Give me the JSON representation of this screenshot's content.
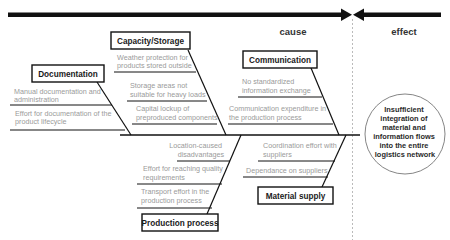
{
  "header": {
    "cause_label": "cause",
    "effect_label": "effect"
  },
  "effect": {
    "lines": [
      "Insufficient",
      "integration of",
      "material and",
      "information flows",
      "into the entire",
      "logistics network"
    ]
  },
  "categories": {
    "documentation": {
      "label": "Documentation",
      "causes": [
        [
          "Manual documentation and",
          "administration"
        ],
        [
          "Effort for documentation of the",
          "product lifecycle"
        ]
      ]
    },
    "capacity_storage": {
      "label": "Capacity/Storage",
      "causes": [
        [
          "Weather protection for",
          "products stored outside"
        ],
        [
          "Storage areas not",
          "suitable for heavy loads"
        ],
        [
          "Capital lockup of",
          "preproduced components"
        ]
      ]
    },
    "communication": {
      "label": "Communication",
      "causes": [
        [
          "No standardized",
          "information exchange"
        ],
        [
          "Communication expenditure in",
          "the production process"
        ]
      ]
    },
    "production_process": {
      "label": "Production process",
      "causes": [
        [
          "Location-caused",
          "disadvantages"
        ],
        [
          "Effort for reaching quality",
          "requirements"
        ],
        [
          "Transport effort in the",
          "production process"
        ]
      ]
    },
    "material_supply": {
      "label": "Material supply",
      "causes": [
        [
          "Coordination effort with",
          "suppliers"
        ],
        [
          "Dependance on suppliers"
        ]
      ]
    }
  },
  "colors": {
    "line": "#111111",
    "cause_text": "#9a9a9a",
    "divider": "#aaaaaa"
  }
}
